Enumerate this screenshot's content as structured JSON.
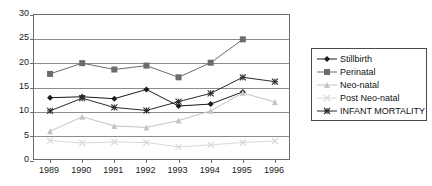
{
  "chart_data": {
    "type": "line",
    "title": "",
    "xlabel": "",
    "ylabel": "",
    "categories": [
      "1989",
      "1990",
      "1991",
      "1992",
      "1993",
      "1994",
      "1995",
      "1996"
    ],
    "x": [
      1989,
      1990,
      1991,
      1992,
      1993,
      1994,
      1995,
      1996
    ],
    "ylim": [
      0,
      30
    ],
    "yticks": [
      0,
      5,
      10,
      15,
      20,
      25,
      30
    ],
    "ytick_labels": [
      "0",
      "5",
      "10",
      "15",
      "20",
      "25",
      "30"
    ],
    "grid": true,
    "legend_position": "right",
    "series": [
      {
        "name": "Stillbirth",
        "marker": "diamond",
        "color": "#1a1a1a",
        "values": [
          13.0,
          13.2,
          12.8,
          14.7,
          11.3,
          11.7,
          14.2,
          null
        ]
      },
      {
        "name": "Perinatal",
        "marker": "square",
        "color": "#6b6b6b",
        "values": [
          17.9,
          20.1,
          18.8,
          19.6,
          17.2,
          20.2,
          25.0,
          null
        ]
      },
      {
        "name": "Neo-natal",
        "marker": "triangle",
        "color": "#c4c4c4",
        "values": [
          6.1,
          9.1,
          7.2,
          6.9,
          8.3,
          10.3,
          14.0,
          12.1
        ]
      },
      {
        "name": "Post Neo-natal",
        "marker": "cross",
        "color": "#d9d9d9",
        "values": [
          4.2,
          3.7,
          3.9,
          3.8,
          2.9,
          3.3,
          3.8,
          4.1
        ]
      },
      {
        "name": "INFANT MORTALITY",
        "marker": "asterisk",
        "color": "#2b2b2b",
        "values": [
          10.3,
          12.9,
          11.0,
          10.4,
          12.2,
          13.9,
          17.2,
          16.3
        ]
      }
    ]
  },
  "legend": {
    "items": [
      {
        "label": "Stillbirth"
      },
      {
        "label": "Perinatal"
      },
      {
        "label": "Neo-natal"
      },
      {
        "label": "Post Neo-natal"
      },
      {
        "label": "INFANT MORTALITY"
      }
    ]
  },
  "colors": {
    "axis": "#6d6d6d",
    "grid": "#8c8c8c",
    "text": "#1a1a1a",
    "background": "#ffffff"
  }
}
